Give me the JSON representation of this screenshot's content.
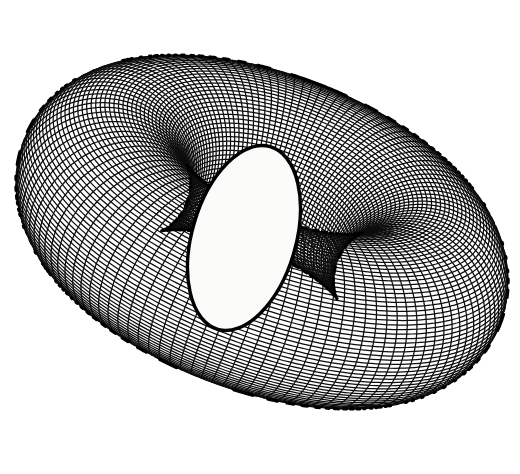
{
  "figure": {
    "render_style": "hidden-line-removed mesh",
    "background_color": "#ffffff",
    "paper_tint": "#fbfbf9",
    "ink_color": "#101010",
    "line_color": "#0d0d0d",
    "silhouette_color": "#000000",
    "caption": "",
    "width": 520,
    "height": 474
  },
  "chart_data": {
    "type": "scatter",
    "xlabel": "",
    "ylabel": "",
    "projection": "orthographic",
    "surface": "torus",
    "major_radius_R": 1.0,
    "minor_radius_r": 0.52,
    "u_lines": 120,
    "v_lines": 120,
    "u_range": [
      0,
      6.283185
    ],
    "v_range": [
      0,
      6.283185
    ],
    "view_rotation_x_deg": -62,
    "view_rotation_y_deg": 26,
    "view_rotation_z_deg": -8,
    "center_x": 262,
    "center_y": 232,
    "scale": 168,
    "hole_center": [
      244,
      238
    ],
    "hole_rx": 52,
    "hole_ry": 95,
    "hole_rotation_deg": 16,
    "grid": false,
    "legend": "none",
    "series": [
      {
        "name": "u-parameter lines",
        "count": 120,
        "orientation": "around-tube"
      },
      {
        "name": "v-parameter lines",
        "count": 120,
        "orientation": "around-ring"
      }
    ],
    "bounds": {
      "x_min": 26,
      "x_max": 492,
      "y_min": 14,
      "y_max": 452
    }
  }
}
